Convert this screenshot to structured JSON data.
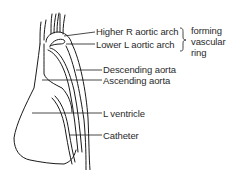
{
  "diagram": {
    "labels": {
      "higher_r_arch": "Higher R aortic arch",
      "lower_l_arch": "Lower L aortic arch",
      "descending_aorta": "Descending aorta",
      "ascending_aorta": "Ascending aorta",
      "l_ventricle": "L ventricle",
      "catheter": "Catheter"
    },
    "bracket_note": {
      "line1": "forming",
      "line2": "vascular",
      "line3": "ring"
    },
    "colors": {
      "stroke": "#1a1a1a",
      "text": "#2a2a2a",
      "background": "#ffffff"
    }
  }
}
